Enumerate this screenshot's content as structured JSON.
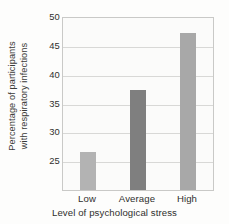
{
  "chart_data": {
    "type": "bar",
    "title": "",
    "categories": [
      "Low",
      "Average",
      "High"
    ],
    "values": [
      26.7,
      37.6,
      47.4
    ],
    "xlabel": "Level of psychological stress",
    "ylabel_line1": "Percentage of participants",
    "ylabel_line2": "with respiratory infections",
    "ylabel": "Percentage of participants with respiratory infections",
    "yticks": [
      25,
      30,
      35,
      40,
      45,
      50
    ],
    "ytick_labels": [
      "25",
      "30",
      "35",
      "40",
      "45",
      "50"
    ],
    "ylim": [
      20.2,
      50
    ],
    "grid": true,
    "legend": "none",
    "bar_colors": [
      "#b3b3b3",
      "#7f7f7f",
      "#a8a8a8"
    ],
    "plot_border_color": "#c9c9c7",
    "gridline_color": "#d8d8d6",
    "background_color": "#fdfdfc",
    "text_color": "#2f2f2d"
  }
}
